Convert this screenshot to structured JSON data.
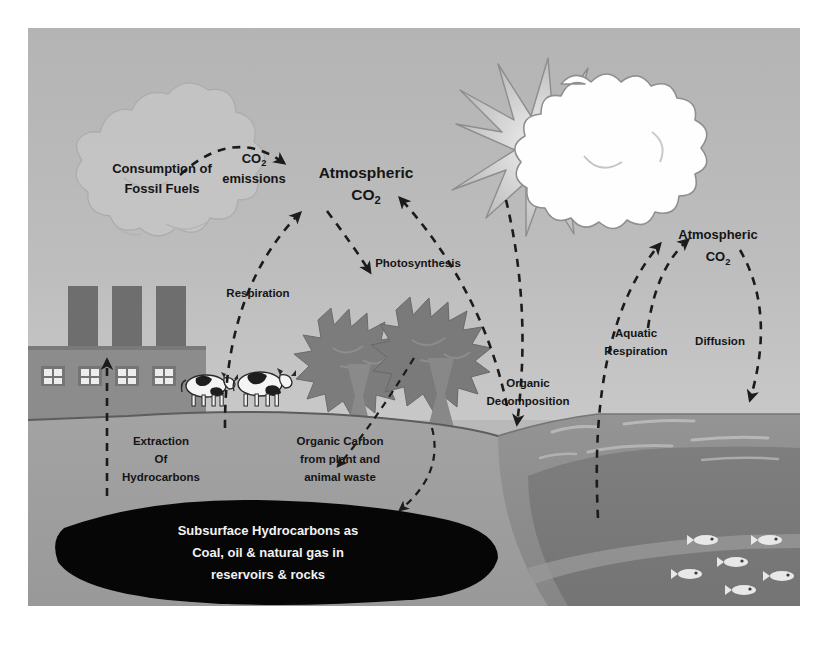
{
  "figure": {
    "frame": {
      "x": 28,
      "y": 28,
      "width": 772,
      "height": 578
    }
  },
  "labels": {
    "consumption_fossil_fuels_line1": "Consumption of",
    "consumption_fossil_fuels_line2": "Fossil Fuels",
    "co2_emissions_line1": "CO",
    "co2_emissions_sub": "2",
    "co2_emissions_line2": "emissions",
    "atmospheric_co2_left_line1": "Atmospheric",
    "atmospheric_co2_left_line2": "CO",
    "atmospheric_co2_left_sub": "2",
    "respiration": "Respiration",
    "photosynthesis": "Photosynthesis",
    "organic_decomposition_line1": "Organic",
    "organic_decomposition_line2": "Decomposition",
    "atmospheric_co2_right_line1": "Atmospheric",
    "atmospheric_co2_right_line2": "CO",
    "atmospheric_co2_right_sub": "2",
    "aquatic_respiration_line1": "Aquatic",
    "aquatic_respiration_line2": "Respiration",
    "diffusion": "Diffusion",
    "extraction_line1": "Extraction",
    "extraction_line2": "Of",
    "extraction_line3": "Hydrocarbons",
    "organic_carbon_line1": "Organic Carbon",
    "organic_carbon_line2": "from plant and",
    "organic_carbon_line3": "animal waste",
    "subsurface_line1": "Subsurface Hydrocarbons as",
    "subsurface_line2": "Coal, oil & natural gas in",
    "subsurface_line3": "reservoirs & rocks"
  },
  "colors": {
    "sky": "#b8b8b8",
    "sky_lower": "#c6c6c6",
    "ground_surface": "#a9a9a9",
    "subsoil": "#9e9e9e",
    "subsoil_deep": "#8f8f8f",
    "reservoir": "#050505",
    "ocean_surface": "#8d8d8d",
    "ocean_deep": "#7a7a7a",
    "factory": "#8b8b8b",
    "stack": "#6f6f6f",
    "tree_canopy": "#7e7e7e",
    "tree_trunk": "#8a8a8a",
    "sun_burst": "#ffffff",
    "sun_ray": "#a0a0a0",
    "smoke_cloud": "#c9c9c9",
    "arrow": "#1b1b1b",
    "text_dark": "#151515",
    "text_light": "#f2f2f2"
  },
  "elements": {
    "sun": "sun-icon",
    "smoke_cloud": "smoke-cloud",
    "factory": "factory",
    "smokestacks": 3,
    "factory_windows": 4,
    "cows": 2,
    "trees": 2,
    "fish_count": 6
  },
  "flows": [
    {
      "name": "co2-emissions-arrow",
      "from": "Consumption of Fossil Fuels",
      "to": "Atmospheric CO2"
    },
    {
      "name": "respiration-arrow",
      "from": "Livestock / land",
      "to": "Atmospheric CO2"
    },
    {
      "name": "photosynthesis-arrow",
      "from": "Atmospheric CO2",
      "to": "Trees"
    },
    {
      "name": "organic-decomposition-arrow",
      "from": "Organic matter",
      "to": "Atmospheric CO2"
    },
    {
      "name": "organic-carbon-arrow",
      "from": "Trees / animal waste",
      "to": "Organic Carbon"
    },
    {
      "name": "extraction-arrow",
      "from": "Subsurface Hydrocarbons",
      "to": "Consumption of Fossil Fuels"
    },
    {
      "name": "aquatic-respiration-arrow",
      "from": "Ocean",
      "to": "Atmospheric CO2"
    },
    {
      "name": "diffusion-arrow",
      "from": "Atmospheric CO2",
      "to": "Ocean"
    }
  ]
}
